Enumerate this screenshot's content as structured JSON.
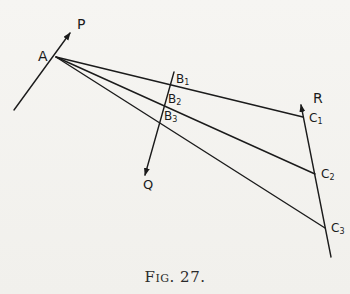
{
  "figure": {
    "caption": "Fig. 27.",
    "stroke_color": "#1b1b1b",
    "background_color": "#f4f3f0"
  },
  "labels": {
    "A": "A",
    "P": "P",
    "Q": "Q",
    "R": "R",
    "B1": {
      "base": "B",
      "sub": "1"
    },
    "B2": {
      "base": "B",
      "sub": "2"
    },
    "B3": {
      "base": "B",
      "sub": "3"
    },
    "C1": {
      "base": "C",
      "sub": "1"
    },
    "C2": {
      "base": "C",
      "sub": "2"
    },
    "C3": {
      "base": "C",
      "sub": "3"
    }
  },
  "geometry": {
    "points": {
      "A": [
        56,
        57
      ],
      "B1": [
        170,
        80
      ],
      "B2": [
        165,
        97
      ],
      "B3": [
        160,
        114
      ],
      "C1": [
        303,
        117
      ],
      "C2": [
        315,
        174
      ],
      "C3": [
        325,
        228
      ]
    },
    "force_lines": [
      {
        "name": "P",
        "from": [
          14,
          110
        ],
        "to": [
          70,
          33
        ],
        "arrow": "end"
      },
      {
        "name": "Q",
        "from": [
          174,
          72
        ],
        "to": [
          145,
          175
        ],
        "arrow": "end"
      },
      {
        "name": "R",
        "from": [
          331,
          257
        ],
        "to": [
          301,
          105
        ],
        "arrow": "end"
      }
    ],
    "rays": [
      {
        "from": "A",
        "through": "B1",
        "to": "C1"
      },
      {
        "from": "A",
        "through": "B2",
        "to": "C2"
      },
      {
        "from": "A",
        "through": "B3",
        "to": "C3"
      }
    ]
  }
}
